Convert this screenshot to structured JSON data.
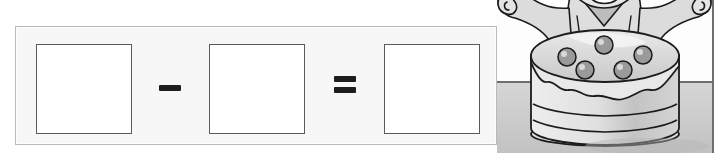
{
  "worksheet": {
    "type": "subtraction-equation-with-blanks",
    "equation": {
      "operand_1_box": "",
      "minus_symbol": "−",
      "operand_2_box": "",
      "equals_symbol": "=",
      "result_box": ""
    },
    "panel_label": "equation answer panel"
  },
  "illustration": {
    "description": "cartoon character holding a layered cake",
    "character": "boy chef with raised arms",
    "object": "two-layer cake topped with six round berries",
    "style": "grayscale line art",
    "colors": {
      "ink": "#1b1b1b",
      "light_gray": "#e3e3e3",
      "mid_gray": "#c6c6c6",
      "shadow_gray": "#a8a8a8",
      "floor_gray": "#cfcfcf",
      "wall_white": "#fdfdfd"
    }
  },
  "theme": {
    "panel_fill": "#f7f7f7",
    "panel_border": "#b9b9b9",
    "box_fill": "#ffffff",
    "box_border": "#5a5a5e",
    "symbol_color": "#1d1d1d",
    "page_background": "#ffffff"
  }
}
